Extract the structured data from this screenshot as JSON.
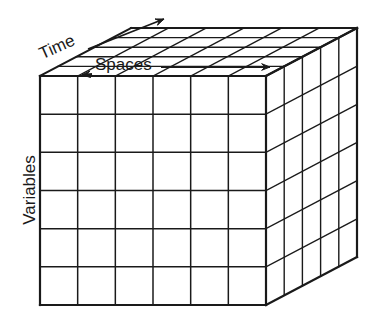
{
  "diagram": {
    "type": "data-cube",
    "labels": {
      "time": "Time",
      "spaces": "Spaces",
      "variables": "Variables"
    },
    "axes": [
      {
        "name": "Time",
        "direction": "depth",
        "arrow": true
      },
      {
        "name": "Spaces",
        "direction": "horizontal",
        "arrow": true
      },
      {
        "name": "Variables",
        "direction": "vertical",
        "arrow": false
      }
    ],
    "grid": {
      "front_columns": 6,
      "front_rows": 6,
      "depth_cells": 5
    },
    "colors": {
      "line": "#1a1a1a",
      "background": "#ffffff"
    }
  }
}
